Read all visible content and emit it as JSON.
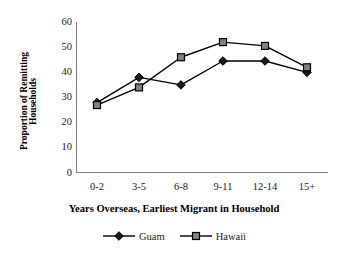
{
  "chart_data": {
    "type": "line",
    "title": "",
    "subtitle": "",
    "xlabel": "Years Overseas, Earliest Migrant in Household",
    "ylabel": "Proportion of Remitting Households",
    "ylabel_lines": [
      "Proportion of Remitting",
      "Households"
    ],
    "categories": [
      "0-2",
      "3-5",
      "6-8",
      "9-11",
      "12-14",
      "15+"
    ],
    "series": [
      {
        "name": "Guam",
        "marker": "diamond",
        "color": "#000000",
        "marker_fill": "#1a1a1a",
        "values": [
          28,
          38,
          35,
          44.5,
          44.5,
          40
        ]
      },
      {
        "name": "Hawaii",
        "marker": "square",
        "color": "#000000",
        "marker_fill": "#808080",
        "values": [
          27,
          34,
          46,
          52,
          50.5,
          42
        ]
      }
    ],
    "ylim": [
      0,
      60
    ],
    "yticks": [
      0,
      10,
      20,
      30,
      40,
      50,
      60
    ],
    "ytick_labels": [
      "0",
      "10",
      "20",
      "30",
      "40",
      "50",
      "60"
    ],
    "grid": false,
    "legend_position": "bottom",
    "axis_color": "#808080"
  }
}
